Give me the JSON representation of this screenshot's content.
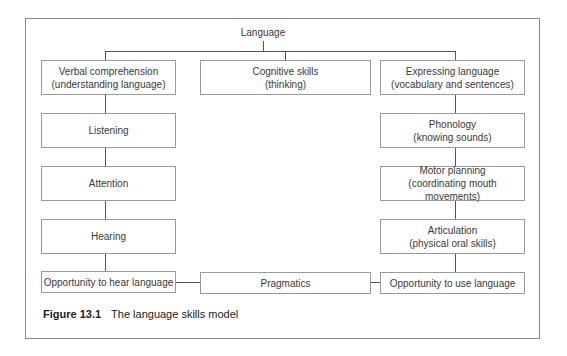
{
  "diagram": {
    "root": "Language",
    "top_row": [
      {
        "title": "Verbal comprehension",
        "subtitle": "(understanding language)"
      },
      {
        "title": "Cognitive skills",
        "subtitle": "(thinking)"
      },
      {
        "title": "Expressing language",
        "subtitle": "(vocabulary and sentences)"
      }
    ],
    "left_column": [
      {
        "title": "Listening"
      },
      {
        "title": "Attention"
      },
      {
        "title": "Hearing"
      }
    ],
    "right_column": [
      {
        "title": "Phonology",
        "subtitle": "(knowing sounds)"
      },
      {
        "title": "Motor planning",
        "subtitle": "(coordinating mouth movements)"
      },
      {
        "title": "Articulation",
        "subtitle": "(physical oral skills)"
      }
    ],
    "bottom_row": [
      {
        "title": "Opportunity to hear language"
      },
      {
        "title": "Pragmatics"
      },
      {
        "title": "Opportunity to use language"
      }
    ]
  },
  "caption": {
    "label": "Figure 13.1",
    "text": "The language skills model"
  }
}
